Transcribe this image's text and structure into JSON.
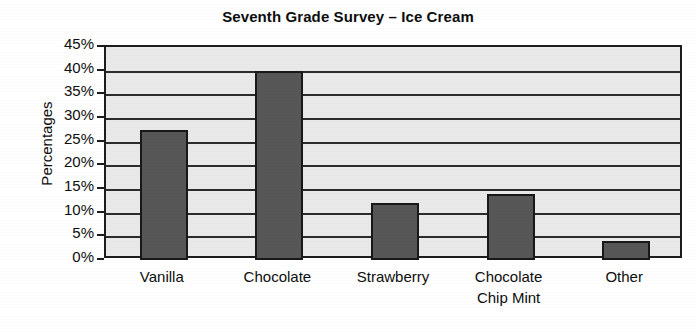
{
  "chart_data": {
    "type": "bar",
    "title": "Seventh Grade Survey – Ice Cream",
    "xlabel": "",
    "ylabel": "Percentages",
    "categories": [
      "Vanilla",
      "Chocolate",
      "Strawberry",
      "Chocolate Chip Mint",
      "Other"
    ],
    "category_lines": [
      [
        "Vanilla"
      ],
      [
        "Chocolate"
      ],
      [
        "Strawberry"
      ],
      [
        "Chocolate",
        "Chip Mint"
      ],
      [
        "Other"
      ]
    ],
    "values": [
      27.5,
      40,
      12,
      14,
      4
    ],
    "ylim": [
      0,
      45
    ],
    "ytick_step": 5,
    "ytick_labels": [
      "45%",
      "40%",
      "35%",
      "30%",
      "25%",
      "20%",
      "15%",
      "10%",
      "5%",
      "0%"
    ],
    "ytick_values": [
      45,
      40,
      35,
      30,
      25,
      20,
      15,
      10,
      5,
      0
    ],
    "grid": true,
    "legend": "none",
    "colors": {
      "bar_fill": "#575757",
      "bar_edge": "#181818",
      "plot_background": "#e9e9e9",
      "axis": "#1c1c1c",
      "gridline": "#2b2b2b",
      "text": "#0d0d0d",
      "page_background": "#ffffff"
    }
  }
}
